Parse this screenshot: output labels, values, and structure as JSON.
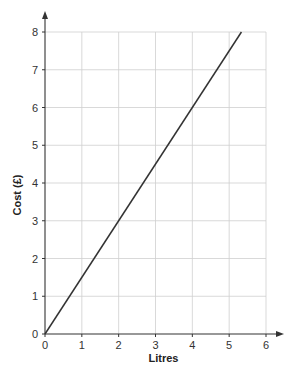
{
  "chart_data": {
    "type": "line",
    "title": "",
    "xlabel": "Litres",
    "ylabel": "Cost (£)",
    "xlim": [
      0,
      6
    ],
    "ylim": [
      0,
      8
    ],
    "x_ticks": [
      "0",
      "1",
      "2",
      "3",
      "4",
      "5",
      "6"
    ],
    "y_ticks": [
      "0",
      "1",
      "2",
      "3",
      "4",
      "5",
      "6",
      "7",
      "8"
    ],
    "grid": true,
    "legend": "none",
    "series": [
      {
        "name": "Cost",
        "x": [
          0,
          5.333
        ],
        "y": [
          0,
          8
        ],
        "slope": 1.5,
        "color": "#333333"
      }
    ]
  }
}
